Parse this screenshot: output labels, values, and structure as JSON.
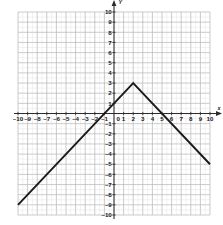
{
  "chart_data": {
    "type": "line",
    "title": "",
    "subtitle": "",
    "xlabel": "x",
    "ylabel": "y",
    "xlim": [
      -10,
      10
    ],
    "ylim": [
      -10,
      10
    ],
    "grid": true,
    "minor_grid_step": 0.5,
    "major_grid_step": 1,
    "legend": false,
    "equation": "y = 3 - |x - 2|",
    "vertex": {
      "x": 2,
      "y": 3
    },
    "x_intercepts": [
      -1,
      5
    ],
    "y_intercept": 1,
    "series": [
      {
        "name": "y = 3 - |x - 2|",
        "color": "#1a1a1a",
        "points": [
          {
            "x": -10,
            "y": -9
          },
          {
            "x": 2,
            "y": 3
          },
          {
            "x": 10,
            "y": -5
          }
        ]
      }
    ],
    "x_ticks": [
      {
        "value": -10,
        "label": "–10"
      },
      {
        "value": -9,
        "label": "–9"
      },
      {
        "value": -8,
        "label": "–8"
      },
      {
        "value": -7,
        "label": "–7"
      },
      {
        "value": -6,
        "label": "–6"
      },
      {
        "value": -5,
        "label": "–5"
      },
      {
        "value": -4,
        "label": "–4"
      },
      {
        "value": -3,
        "label": "–3"
      },
      {
        "value": -2,
        "label": "–2"
      },
      {
        "value": -1,
        "label": "–1"
      },
      {
        "value": 0,
        "label": "0"
      },
      {
        "value": 1,
        "label": "1"
      },
      {
        "value": 2,
        "label": "2"
      },
      {
        "value": 3,
        "label": "3"
      },
      {
        "value": 4,
        "label": "4"
      },
      {
        "value": 5,
        "label": "5"
      },
      {
        "value": 6,
        "label": "6"
      },
      {
        "value": 7,
        "label": "7"
      },
      {
        "value": 8,
        "label": "8"
      },
      {
        "value": 9,
        "label": "9"
      },
      {
        "value": 10,
        "label": "10"
      }
    ],
    "y_ticks": [
      {
        "value": 10,
        "label": "10"
      },
      {
        "value": 9,
        "label": "9"
      },
      {
        "value": 8,
        "label": "8"
      },
      {
        "value": 7,
        "label": "7"
      },
      {
        "value": 6,
        "label": "6"
      },
      {
        "value": 5,
        "label": "5"
      },
      {
        "value": 4,
        "label": "4"
      },
      {
        "value": 3,
        "label": "3"
      },
      {
        "value": 2,
        "label": "2"
      },
      {
        "value": 1,
        "label": "1"
      },
      {
        "value": -1,
        "label": "–1"
      },
      {
        "value": -2,
        "label": "–2"
      },
      {
        "value": -3,
        "label": "–3"
      },
      {
        "value": -4,
        "label": "–4"
      },
      {
        "value": -5,
        "label": "–5"
      },
      {
        "value": -6,
        "label": "–6"
      },
      {
        "value": -7,
        "label": "–7"
      },
      {
        "value": -8,
        "label": "–8"
      },
      {
        "value": -9,
        "label": "–9"
      },
      {
        "value": -10,
        "label": "–10"
      }
    ],
    "colors": {
      "curve": "#1a1a1a",
      "axis": "#2b2b2b",
      "major_grid": "#b6b6b6",
      "minor_grid": "#e4e4e4",
      "background": "#ffffff",
      "label": "#1a1a1a"
    }
  },
  "axis_labels": {
    "x_axis_name": "x",
    "y_axis_name": "y"
  }
}
